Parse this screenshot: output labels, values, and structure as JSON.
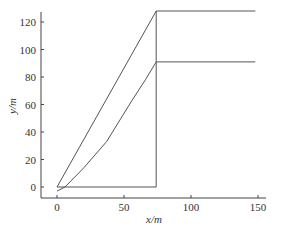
{
  "chart_data": {
    "type": "line",
    "title": "",
    "xlabel": "x/m",
    "ylabel": "y/m",
    "xlim": [
      -8,
      152
    ],
    "ylim": [
      -8,
      128
    ],
    "x_ticks": [
      0,
      50,
      100,
      150
    ],
    "y_ticks": [
      0,
      20,
      40,
      60,
      80,
      100,
      120
    ],
    "grid": false,
    "legend": null,
    "series": [
      {
        "name": "straight line path",
        "points": [
          [
            0,
            0
          ],
          [
            74,
            128
          ],
          [
            148,
            128
          ]
        ]
      },
      {
        "name": "curved path",
        "points": [
          [
            0,
            -3
          ],
          [
            6,
            0
          ],
          [
            20,
            14
          ],
          [
            37,
            33
          ],
          [
            56,
            63
          ],
          [
            66,
            78
          ],
          [
            74,
            91
          ],
          [
            148,
            91
          ]
        ]
      },
      {
        "name": "bottom segment with vertical",
        "points": [
          [
            0,
            0
          ],
          [
            74,
            0
          ],
          [
            74,
            128
          ]
        ]
      }
    ],
    "line_color": "#555555"
  }
}
